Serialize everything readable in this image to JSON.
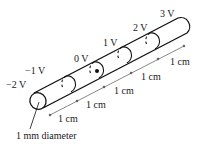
{
  "diagram": {
    "type": "cylindrical wire with equipotential cross-sections",
    "potentials": [
      {
        "label": "−2 V",
        "x": 6,
        "y": 80
      },
      {
        "label": "−1 V",
        "x": 25,
        "y": 66
      },
      {
        "label": "0 V",
        "x": 74,
        "y": 54
      },
      {
        "label": "1 V",
        "x": 103,
        "y": 38
      },
      {
        "label": "2 V",
        "x": 133,
        "y": 23
      },
      {
        "label": "3 V",
        "x": 160,
        "y": 9
      }
    ],
    "spacings": [
      {
        "label": "1 cm",
        "x": 58,
        "y": 115
      },
      {
        "label": "1 cm",
        "x": 86,
        "y": 101
      },
      {
        "label": "1 cm",
        "x": 114,
        "y": 87
      },
      {
        "label": "1 cm",
        "x": 141,
        "y": 73
      },
      {
        "label": "1 cm",
        "x": 170,
        "y": 58
      }
    ],
    "diameter_label": "1 mm diameter",
    "colors": {
      "stroke": "#111111",
      "text": "#1a1a1a"
    }
  }
}
